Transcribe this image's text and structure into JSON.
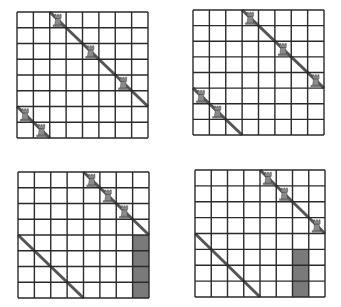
{
  "figure": {
    "colors": {
      "grid_line": "#2a2a2a",
      "diagonal": "#555555",
      "shade": "#7a7a7a",
      "rook_body": "#8a8a8a",
      "rook_outline": "#333333",
      "background": "#ffffff"
    },
    "boards": [
      {
        "id": "board-1",
        "size": 8,
        "rooks": [
          [
            0,
            2
          ],
          [
            2,
            4
          ],
          [
            4,
            6
          ],
          [
            6,
            0
          ],
          [
            7,
            1
          ]
        ],
        "diagonals": [
          {
            "from": [
              2,
              0
            ],
            "to": [
              8,
              6
            ]
          },
          {
            "from": [
              0,
              6
            ],
            "to": [
              2,
              8
            ]
          }
        ],
        "shaded": []
      },
      {
        "id": "board-2",
        "size": 8,
        "rooks": [
          [
            0,
            3
          ],
          [
            2,
            5
          ],
          [
            4,
            7
          ],
          [
            5,
            0
          ],
          [
            6,
            1
          ]
        ],
        "diagonals": [
          {
            "from": [
              3,
              0
            ],
            "to": [
              8,
              5
            ]
          },
          {
            "from": [
              0,
              5
            ],
            "to": [
              3,
              8
            ]
          }
        ],
        "shaded": []
      },
      {
        "id": "board-3",
        "size": 8,
        "rooks": [
          [
            0,
            4
          ],
          [
            1,
            5
          ],
          [
            2,
            6
          ]
        ],
        "diagonals": [
          {
            "from": [
              4,
              0
            ],
            "to": [
              8,
              4
            ]
          },
          {
            "from": [
              0,
              4
            ],
            "to": [
              4,
              8
            ]
          }
        ],
        "shaded": [
          [
            4,
            7
          ],
          [
            5,
            7
          ],
          [
            6,
            7
          ],
          [
            7,
            7
          ]
        ]
      },
      {
        "id": "board-4",
        "size": 8,
        "rooks": [
          [
            0,
            4
          ],
          [
            1,
            5
          ],
          [
            3,
            7
          ]
        ],
        "diagonals": [
          {
            "from": [
              4,
              0
            ],
            "to": [
              8,
              4
            ]
          },
          {
            "from": [
              0,
              4
            ],
            "to": [
              4,
              8
            ]
          }
        ],
        "shaded": [
          [
            5,
            6
          ],
          [
            6,
            6
          ],
          [
            7,
            6
          ]
        ]
      }
    ]
  }
}
